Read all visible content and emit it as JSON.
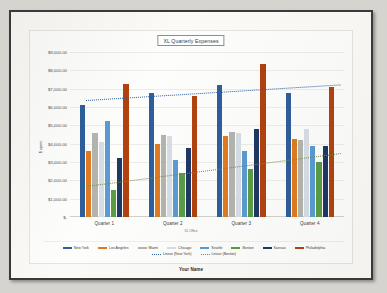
{
  "document": {
    "footer_name": "Your Name"
  },
  "chart_data": {
    "type": "bar",
    "title": "XL Quarterly Expenses",
    "xlabel": "XL Office",
    "ylabel": "$ spent",
    "categories": [
      "Quarter 1",
      "Quarter 2",
      "Quarter 3",
      "Quarter 4"
    ],
    "ylim": [
      0,
      9000
    ],
    "yticks": [
      0,
      1000,
      2000,
      3000,
      4000,
      5000,
      6000,
      7000,
      8000,
      9000
    ],
    "ytick_labels": [
      "$-",
      "$1,000.00",
      "$2,000.00",
      "$3,000.00",
      "$4,000.00",
      "$5,000.00",
      "$6,000.00",
      "$7,000.00",
      "$8,000.00",
      "$9,000.00"
    ],
    "grid": true,
    "legend_position": "bottom",
    "series": [
      {
        "name": "New York",
        "color": "#2e5f9a",
        "values": [
          6100,
          6750,
          7200,
          6750
        ]
      },
      {
        "name": "Los Angeles",
        "color": "#e07a22",
        "values": [
          3600,
          4000,
          4400,
          4250
        ]
      },
      {
        "name": "Miami",
        "color": "#b4b4ae",
        "values": [
          4600,
          4450,
          4650,
          4200
        ]
      },
      {
        "name": "Chicago",
        "color": "#d6dde5",
        "values": [
          4100,
          4400,
          4600,
          4800
        ]
      },
      {
        "name": "Seattle",
        "color": "#5b9bd0",
        "values": [
          5250,
          3100,
          3600,
          3850
        ]
      },
      {
        "name": "Boston",
        "color": "#5b9b45",
        "values": [
          1500,
          2400,
          2600,
          3000
        ]
      },
      {
        "name": "Kansas",
        "color": "#1f3864",
        "values": [
          3200,
          3750,
          4800,
          3850
        ]
      },
      {
        "name": "Philadelphia",
        "color": "#b1420f",
        "values": [
          7250,
          6600,
          8350,
          7100
        ]
      }
    ],
    "trendlines": [
      {
        "name": "Linear (New York)",
        "color": "#2e5f9a",
        "style": "dotted",
        "y_start": 6400,
        "y_end": 7250
      },
      {
        "name": "Linear (Boston)",
        "color": "#7a8c4f",
        "style": "dotted",
        "y_start": 1700,
        "y_end": 3500
      }
    ]
  },
  "legend": {
    "entries": [
      {
        "label": "New York",
        "color": "#2e5f9a",
        "dotted": false
      },
      {
        "label": "Los Angeles",
        "color": "#e07a22",
        "dotted": false
      },
      {
        "label": "Miami",
        "color": "#b4b4ae",
        "dotted": false
      },
      {
        "label": "Chicago",
        "color": "#d6dde5",
        "dotted": false
      },
      {
        "label": "Seattle",
        "color": "#5b9bd0",
        "dotted": false
      },
      {
        "label": "Boston",
        "color": "#5b9b45",
        "dotted": false
      },
      {
        "label": "Kansas",
        "color": "#1f3864",
        "dotted": false
      },
      {
        "label": "Philadelphia",
        "color": "#b1420f",
        "dotted": false
      },
      {
        "label": "Linear (New York)",
        "color": "#2e5f9a",
        "dotted": true
      },
      {
        "label": "Linear (Boston)",
        "color": "#7a8c4f",
        "dotted": true
      }
    ]
  }
}
